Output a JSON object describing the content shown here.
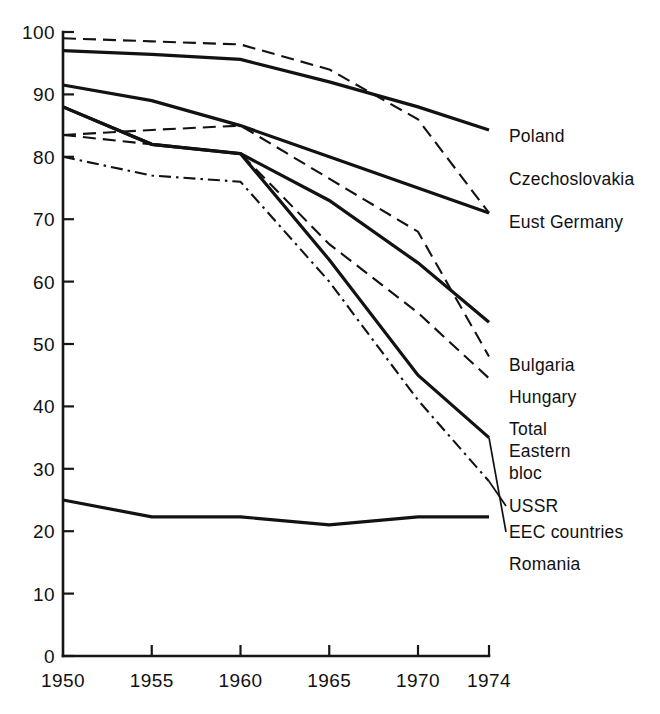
{
  "chart_data": {
    "type": "line",
    "title": "",
    "subtitle": "",
    "xlabel": "",
    "ylabel": "",
    "x": [
      1950,
      1955,
      1960,
      1965,
      1970,
      1974
    ],
    "xtick_labels": [
      "1950",
      "1955",
      "1960",
      "1965",
      "1970",
      "1974"
    ],
    "ytick_labels": [
      "0",
      "10",
      "20",
      "30",
      "40",
      "50",
      "60",
      "70",
      "80",
      "90",
      "100"
    ],
    "ytick_values": [
      0,
      10,
      20,
      30,
      40,
      50,
      60,
      70,
      80,
      90,
      100
    ],
    "ylim": [
      0,
      100
    ],
    "xlim": [
      1950,
      1974
    ],
    "grid": false,
    "legend_position": "right-inline-labels",
    "series": [
      {
        "name": "Poland",
        "label": "Poland",
        "style": "solid",
        "values": [
          97.0,
          96.4,
          95.6,
          92.0,
          88.0,
          84.3
        ]
      },
      {
        "name": "Czechoslovakia",
        "label": "Czechoslovakia",
        "style": "solid",
        "values": [
          91.5,
          89.0,
          85.0,
          80.0,
          75.0,
          71.0
        ]
      },
      {
        "name": "East Germany",
        "label": "Eust Germany",
        "style": "dashed",
        "values": [
          99.0,
          98.5,
          98.0,
          94.0,
          86.0,
          71.0
        ]
      },
      {
        "name": "Bulgaria",
        "label": "Bulgaria",
        "style": "solid",
        "values": [
          88.0,
          82.0,
          80.5,
          73.0,
          63.0,
          53.5
        ]
      },
      {
        "name": "Hungary",
        "label": "Hungary",
        "style": "dashed",
        "values": [
          83.5,
          84.3,
          85.0,
          76.5,
          68.0,
          48.0
        ]
      },
      {
        "name": "Total Eastern bloc",
        "label": "Total Eastern bloc",
        "label_lines": [
          "Total",
          "Eastern",
          "bloc"
        ],
        "style": "dashed",
        "values": [
          83.5,
          82.0,
          80.5,
          66.0,
          55.0,
          44.5
        ]
      },
      {
        "name": "USSR",
        "label": "USSR",
        "style": "dash-dot",
        "values": [
          80.0,
          77.0,
          76.0,
          60.0,
          41.0,
          28.0
        ]
      },
      {
        "name": "EEC countries",
        "label": "EEC countries",
        "style": "solid",
        "values": [
          88.0,
          82.0,
          80.5,
          63.5,
          45.0,
          35.0
        ]
      },
      {
        "name": "Romania",
        "label": "Romania",
        "style": "solid",
        "values": [
          25.0,
          22.3,
          22.3,
          21.0,
          22.3,
          22.3
        ]
      }
    ]
  },
  "labels": {
    "poland": "Poland",
    "czechoslovakia": "Czechoslovakia",
    "east_germany": "Eust Germany",
    "bulgaria": "Bulgaria",
    "hungary": "Hungary",
    "total_line1": "Total",
    "total_line2": "Eastern",
    "total_line3": "bloc",
    "ussr": "USSR",
    "eec": "EEC countries",
    "romania": "Romania"
  },
  "colors": {
    "ink": "#121212",
    "background": "#ffffff"
  }
}
